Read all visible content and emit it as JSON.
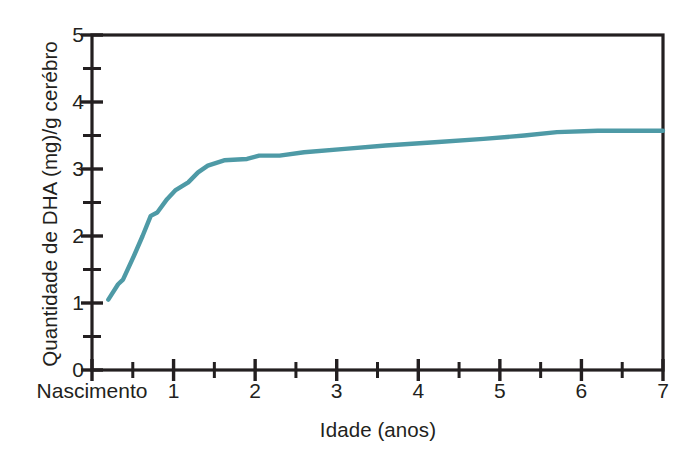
{
  "chart_data": {
    "type": "line",
    "title": "",
    "xlabel": "Idade (anos)",
    "ylabel": "Quantidade de DHA (mg)/g cerébro",
    "xlim": [
      0,
      7
    ],
    "ylim": [
      0,
      5
    ],
    "grid": false,
    "legend": null,
    "line_color": "#4e9aa6",
    "axis_color": "#231f20",
    "x_tick_labels": [
      "Nascimento",
      "1",
      "2",
      "3",
      "4",
      "5",
      "6",
      "7"
    ],
    "x_tick_values": [
      0,
      1,
      2,
      3,
      4,
      5,
      6,
      7
    ],
    "x_minor_tick_values": [
      0.5,
      1.5,
      2.5,
      3.5,
      4.5,
      5.5,
      6.5
    ],
    "y_tick_labels": [
      "0",
      "1",
      "2",
      "3",
      "4",
      "5"
    ],
    "y_tick_values": [
      0,
      1,
      2,
      3,
      4,
      5
    ],
    "y_minor_tick_values": [
      0.5,
      1.5,
      2.5,
      3.5,
      4.5
    ],
    "series": [
      {
        "name": "DHA no cérebro",
        "x": [
          0.2,
          0.32,
          0.38,
          0.52,
          0.62,
          0.72,
          0.8,
          0.92,
          1.02,
          1.18,
          1.3,
          1.42,
          1.62,
          1.9,
          2.05,
          2.3,
          2.6,
          3.1,
          3.6,
          4.2,
          4.8,
          5.3,
          5.7,
          6.2,
          6.7,
          7.0
        ],
        "y": [
          1.05,
          1.28,
          1.35,
          1.72,
          2.0,
          2.3,
          2.35,
          2.55,
          2.68,
          2.8,
          2.95,
          3.05,
          3.13,
          3.15,
          3.2,
          3.2,
          3.25,
          3.3,
          3.35,
          3.4,
          3.45,
          3.5,
          3.55,
          3.57,
          3.57,
          3.57
        ]
      }
    ]
  },
  "axis_labels": {
    "y_axis_title": "Quantidade de DHA (mg)/g cerébro",
    "x_axis_title": "Idade (anos)"
  }
}
